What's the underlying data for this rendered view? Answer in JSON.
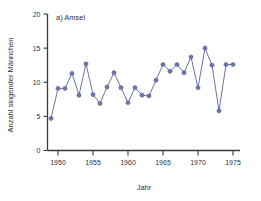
{
  "chart_data": {
    "type": "line",
    "title": "a) Amsel",
    "xlabel": "Jahr",
    "ylabel": "Anzahl singender Männchen",
    "xlim": [
      1948.5,
      1976.0
    ],
    "ylim": [
      0,
      20
    ],
    "xticks": [
      1950,
      1955,
      1960,
      1965,
      1970,
      1975
    ],
    "xtick_labels": [
      "1950",
      "1955",
      "1960",
      "1965",
      "1970",
      "1975"
    ],
    "yticks": [
      0,
      5,
      10,
      15,
      20
    ],
    "ytick_labels": [
      "0",
      "5",
      "10",
      "15",
      "20"
    ],
    "grid": false,
    "legend": false,
    "marker": "circle",
    "series_color": "#6d75aa",
    "x": [
      1949,
      1950,
      1951,
      1952,
      1953,
      1954,
      1955,
      1956,
      1957,
      1958,
      1959,
      1960,
      1961,
      1962,
      1963,
      1964,
      1965,
      1966,
      1967,
      1968,
      1969,
      1970,
      1971,
      1972,
      1973,
      1974,
      1975
    ],
    "values": [
      4.7,
      9.1,
      9.1,
      11.3,
      8.1,
      12.7,
      8.2,
      6.9,
      9.3,
      11.4,
      9.2,
      7.0,
      9.2,
      8.1,
      8.0,
      10.3,
      12.6,
      11.6,
      12.6,
      11.4,
      13.7,
      9.2,
      15.0,
      12.5,
      5.8,
      12.6,
      12.6
    ],
    "series": [
      {
        "name": "Anzahl singender Männchen",
        "values": [
          4.7,
          9.1,
          9.1,
          11.3,
          8.1,
          12.7,
          8.2,
          6.9,
          9.3,
          11.4,
          9.2,
          7.0,
          9.2,
          8.1,
          8.0,
          10.3,
          12.6,
          11.6,
          12.6,
          11.4,
          13.7,
          9.2,
          15.0,
          12.5,
          5.8,
          12.6,
          12.6
        ]
      }
    ]
  }
}
